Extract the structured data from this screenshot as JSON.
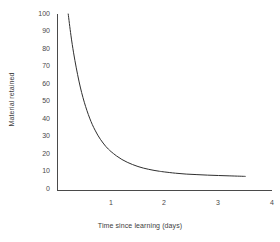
{
  "chart_data": {
    "type": "line",
    "title": "",
    "subtitle": "",
    "xlabel": "Time since learning (days)",
    "ylabel": "Material retained",
    "xlim": [
      0,
      4
    ],
    "ylim": [
      0,
      100
    ],
    "grid": false,
    "legend": false,
    "legend_position": "none",
    "xticks": [
      1,
      2,
      3,
      4
    ],
    "xtick_labels": [
      "1",
      "2",
      "3",
      "4"
    ],
    "yticks": [
      0,
      10,
      20,
      30,
      40,
      50,
      60,
      70,
      80,
      90,
      100
    ],
    "ytick_labels": [
      "0",
      "10",
      "20",
      "30",
      "40",
      "50",
      "60",
      "70",
      "80",
      "90",
      "100"
    ],
    "annotations": [],
    "series": [
      {
        "name": "Material retained",
        "color": "#2f2f2f",
        "x": [
          0.2,
          0.25,
          0.3,
          0.35,
          0.4,
          0.45,
          0.5,
          0.55,
          0.6,
          0.65,
          0.7,
          0.75,
          0.8,
          0.85,
          0.9,
          0.95,
          1.0,
          1.1,
          1.2,
          1.3,
          1.4,
          1.5,
          1.6,
          1.7,
          1.8,
          1.9,
          2.0,
          2.2,
          2.4,
          2.6,
          2.8,
          3.0,
          3.2,
          3.4,
          3.5
        ],
        "y": [
          100.0,
          88.0,
          78.0,
          69.5,
          62.0,
          55.5,
          50.0,
          45.2,
          41.0,
          37.3,
          34.2,
          31.4,
          29.0,
          26.9,
          25.0,
          23.4,
          22.0,
          19.6,
          17.6,
          16.0,
          14.7,
          13.6,
          12.7,
          12.0,
          11.4,
          10.9,
          10.5,
          9.8,
          9.3,
          9.0,
          8.7,
          8.5,
          8.3,
          8.1,
          8.0
        ]
      }
    ]
  },
  "axes": {
    "y_title": "Material retained",
    "x_title": "Time since learning (days)"
  },
  "colors": {
    "background": "#ffffff",
    "axis": "#4a4a4a",
    "curve": "#2f2f2f",
    "text": "#4a4a4a"
  }
}
